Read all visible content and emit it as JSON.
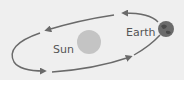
{
  "diagram": {
    "labels": {
      "sun": "Sun",
      "earth": "Earth"
    },
    "colors": {
      "background": "#efefef",
      "orbit": "#6a6a6a",
      "sun": "#c4c4c4",
      "earth": "#6b6b6b",
      "text": "#555555"
    },
    "orbit_direction": "counter-clockwise"
  }
}
